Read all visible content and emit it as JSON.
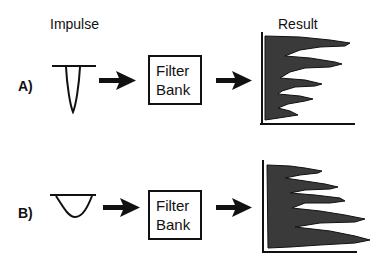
{
  "headers": {
    "impulse": "Impulse",
    "result": "Result"
  },
  "rows": [
    {
      "label": "A)",
      "impulse_shape": "narrow-v",
      "filter_box": {
        "line1": "Filter",
        "line2": "Bank"
      },
      "result_peaks_x": [
        350,
        342,
        322,
        313,
        298
      ]
    },
    {
      "label": "B)",
      "impulse_shape": "wide-u",
      "filter_box": {
        "line1": "Filter",
        "line2": "Bank"
      },
      "result_peaks_x": [
        322,
        338,
        345,
        365,
        370
      ]
    }
  ],
  "colors": {
    "ink": "#111111",
    "fill": "#3a3a3a",
    "background": "#ffffff"
  }
}
